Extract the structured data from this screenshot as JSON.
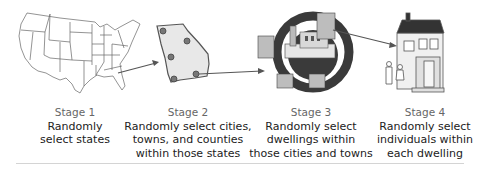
{
  "diagram": {
    "type": "multistage-sampling-process",
    "stages": [
      {
        "title": "Stage 1",
        "lines": [
          "Randomly",
          "select states"
        ],
        "icon": "us-map-icon"
      },
      {
        "title": "Stage 2",
        "lines": [
          "Randomly select cities,",
          "towns, and counties",
          "within those states"
        ],
        "icon": "state-map-with-cities-icon"
      },
      {
        "title": "Stage 3",
        "lines": [
          "Randomly select",
          "dwellings within",
          "those cities and towns"
        ],
        "icon": "city-dwellings-circle-icon"
      },
      {
        "title": "Stage 4",
        "lines": [
          "Randomly select",
          "individuals within",
          "each dwelling"
        ],
        "icon": "house-with-people-icon"
      }
    ],
    "arrows": [
      "stage1-to-stage2",
      "stage2-to-stage3",
      "stage3-to-stage4"
    ],
    "colors": {
      "line": "#555555",
      "fill_light": "#e8e8e8",
      "fill_dark": "#3a3a3a",
      "text": "#222222",
      "title": "#666666",
      "divider": "#d4d4d4"
    }
  }
}
